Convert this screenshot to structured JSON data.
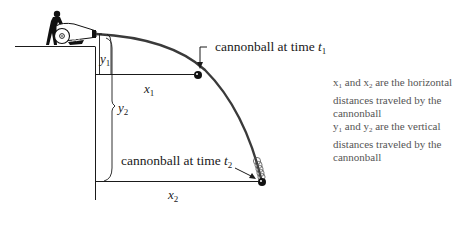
{
  "diagram": {
    "type": "projectile-motion",
    "title": "",
    "callouts": {
      "t1": {
        "text": "cannonball at time ",
        "var": "t",
        "sub": "1"
      },
      "t2": {
        "text": "cannonball at time ",
        "var": "t",
        "sub": "2"
      }
    },
    "variables": {
      "x1": {
        "var": "x",
        "sub": "1"
      },
      "x2": {
        "var": "x",
        "sub": "2"
      },
      "y1": {
        "var": "y",
        "sub": "1"
      },
      "y2": {
        "var": "y",
        "sub": "2"
      }
    },
    "notes": [
      {
        "a": "x",
        "a_sub": "1",
        "mid": " and ",
        "b": "x",
        "b_sub": "2",
        "rest": " are the horizontal distances traveled by the cannonball"
      },
      {
        "a": "y",
        "a_sub": "1",
        "mid": " and ",
        "b": "y",
        "b_sub": "2",
        "rest": " are the vertical distances traveled by the cannonball"
      }
    ],
    "colors": {
      "line": "#1a1a1a",
      "trajectory": "#3a3a3a",
      "note_text": "#555555",
      "background": "#ffffff"
    }
  }
}
